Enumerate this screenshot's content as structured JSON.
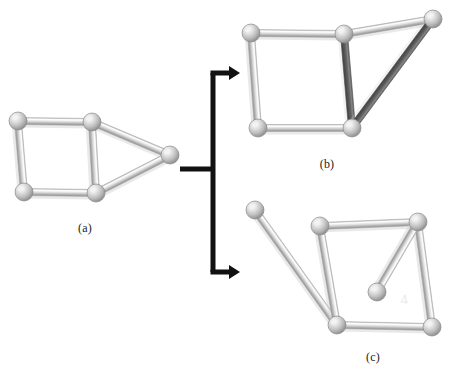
{
  "figure": {
    "kind": "ball-and-stick-graph-diagram",
    "background_color": "#ffffff",
    "caption_labels": [
      {
        "text": "(a)",
        "x": 85,
        "y": 228
      },
      {
        "text": "(b)",
        "x": 327,
        "y": 164
      },
      {
        "text": "(c)",
        "x": 373,
        "y": 357
      }
    ],
    "palette": {
      "node_fill_light": "#d9d9d9",
      "node_fill_mid": "#b5b5b5",
      "node_highlight": "#f2f2f2",
      "node_outline": "#8a8a8a",
      "edge_light": "#d5d5d5",
      "edge_light_shade": "#a8a8a8",
      "edge_dark": "#5a5a5a",
      "edge_dark_shade": "#474747",
      "arrow_color": "#111111",
      "shadow_color": "#cfcfcf"
    },
    "geometry": {
      "node_radius": 9,
      "edge_width": 7,
      "arrow_stroke": 5
    },
    "panels": [
      {
        "id": "panel-a",
        "label": "(a)",
        "nodes": [
          {
            "id": "a1",
            "x": 18,
            "y": 121
          },
          {
            "id": "a2",
            "x": 92,
            "y": 122
          },
          {
            "id": "a3",
            "x": 24,
            "y": 192
          },
          {
            "id": "a4",
            "x": 96,
            "y": 193
          },
          {
            "id": "a5",
            "x": 170,
            "y": 155
          }
        ],
        "edges": [
          {
            "from": "a1",
            "to": "a2",
            "style": "light"
          },
          {
            "from": "a1",
            "to": "a3",
            "style": "light"
          },
          {
            "from": "a3",
            "to": "a4",
            "style": "light"
          },
          {
            "from": "a2",
            "to": "a4",
            "style": "light"
          },
          {
            "from": "a2",
            "to": "a5",
            "style": "light"
          },
          {
            "from": "a4",
            "to": "a5",
            "style": "light"
          }
        ]
      },
      {
        "id": "panel-b",
        "label": "(b)",
        "nodes": [
          {
            "id": "b1",
            "x": 251,
            "y": 33
          },
          {
            "id": "b2",
            "x": 344,
            "y": 34
          },
          {
            "id": "b3",
            "x": 433,
            "y": 19
          },
          {
            "id": "b4",
            "x": 258,
            "y": 128
          },
          {
            "id": "b5",
            "x": 352,
            "y": 128
          }
        ],
        "edges": [
          {
            "from": "b1",
            "to": "b2",
            "style": "light"
          },
          {
            "from": "b1",
            "to": "b4",
            "style": "light"
          },
          {
            "from": "b4",
            "to": "b5",
            "style": "light"
          },
          {
            "from": "b2",
            "to": "b3",
            "style": "light"
          },
          {
            "from": "b2",
            "to": "b5",
            "style": "dark"
          },
          {
            "from": "b3",
            "to": "b5",
            "style": "dark"
          }
        ]
      },
      {
        "id": "panel-c",
        "label": "(c)",
        "nodes": [
          {
            "id": "c1",
            "x": 255,
            "y": 210
          },
          {
            "id": "c2",
            "x": 320,
            "y": 226
          },
          {
            "id": "c3",
            "x": 418,
            "y": 222
          },
          {
            "id": "c4",
            "x": 337,
            "y": 325
          },
          {
            "id": "c5",
            "x": 432,
            "y": 327
          },
          {
            "id": "c6",
            "x": 377,
            "y": 292
          }
        ],
        "edges": [
          {
            "from": "c1",
            "to": "c4",
            "style": "light"
          },
          {
            "from": "c2",
            "to": "c3",
            "style": "light"
          },
          {
            "from": "c2",
            "to": "c4",
            "style": "light"
          },
          {
            "from": "c4",
            "to": "c5",
            "style": "light"
          },
          {
            "from": "c3",
            "to": "c5",
            "style": "light"
          },
          {
            "from": "c3",
            "to": "c6",
            "style": "light"
          }
        ]
      }
    ],
    "arrow": {
      "name": "branching-transformation-arrow",
      "stem": {
        "x1": 180,
        "y1": 169,
        "x2": 213,
        "y2": 169
      },
      "trunk": {
        "x": 213,
        "y1": 73,
        "y2": 272
      },
      "branches": [
        {
          "id": "arrow-to-b",
          "x1": 213,
          "y1": 73,
          "x2": 240,
          "y2": 73
        },
        {
          "id": "arrow-to-c",
          "x1": 213,
          "y1": 272,
          "x2": 240,
          "y2": 272
        }
      ],
      "head_length": 11,
      "head_half_width": 7
    },
    "watermarks": [
      {
        "text": "4",
        "x": 404,
        "y": 300
      }
    ]
  }
}
